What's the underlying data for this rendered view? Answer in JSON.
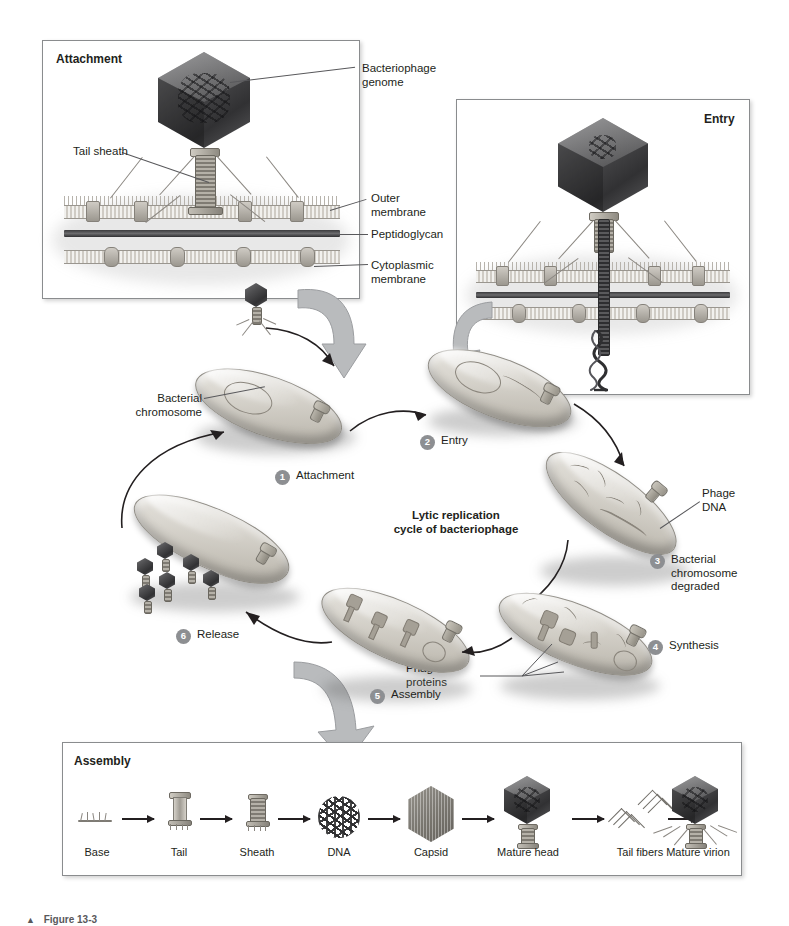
{
  "figure": {
    "caption_marker": "▲",
    "caption_text": "Figure 13-3"
  },
  "panels": {
    "attachment": {
      "title": "Attachment",
      "labels": [
        {
          "id": "bacteriophage-genome",
          "text": "Bacteriophage\ngenome"
        },
        {
          "id": "tail-sheath",
          "text": "Tail sheath"
        },
        {
          "id": "outer-membrane",
          "text": "Outer\nmembrane"
        },
        {
          "id": "peptidoglycan",
          "text": "Peptidoglycan"
        },
        {
          "id": "cytoplasmic-membrane",
          "text": "Cytoplasmic\nmembrane"
        }
      ]
    },
    "entry": {
      "title": "Entry"
    },
    "assembly": {
      "title": "Assembly",
      "stages": [
        {
          "id": "base",
          "label": "Base"
        },
        {
          "id": "tail",
          "label": "Tail"
        },
        {
          "id": "sheath",
          "label": "Sheath"
        },
        {
          "id": "dna",
          "label": "DNA"
        },
        {
          "id": "capsid",
          "label": "Capsid"
        },
        {
          "id": "mature-head",
          "label": "Mature head"
        },
        {
          "id": "tail-fibers",
          "label": "Tail fibers"
        },
        {
          "id": "mature-virion",
          "label": "Mature virion"
        }
      ]
    }
  },
  "cycle": {
    "title": "Lytic replication\ncycle of bacteriophage",
    "steps": [
      {
        "number": "1",
        "label": "Attachment"
      },
      {
        "number": "2",
        "label": "Entry"
      },
      {
        "number": "3",
        "label": "Bacterial\nchromosome\ndegraded"
      },
      {
        "number": "4",
        "label": "Synthesis"
      },
      {
        "number": "5",
        "label": "Assembly"
      },
      {
        "number": "6",
        "label": "Release"
      }
    ],
    "callouts": [
      {
        "id": "bacterial-chromosome",
        "text": "Bacterial\nchromosome"
      },
      {
        "id": "phage-dna",
        "text": "Phage\nDNA"
      },
      {
        "id": "phage-proteins",
        "text": "Phage\nproteins"
      }
    ]
  },
  "colors": {
    "badge": "#8d8f92",
    "text": "#231f20",
    "panel_border": "#8a8c8e",
    "big_arrow": "#b9bbbd",
    "leader": "#58585b"
  }
}
